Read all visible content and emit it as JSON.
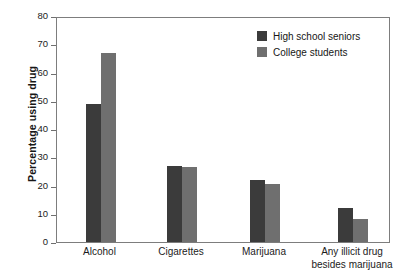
{
  "chart_data": {
    "type": "bar",
    "title": "",
    "xlabel": "",
    "ylabel": "Percentage using drug",
    "ylim": [
      0,
      80
    ],
    "yticks": [
      0,
      10,
      20,
      30,
      40,
      50,
      60,
      70,
      80
    ],
    "ytick_labels": [
      "0",
      "10",
      "20",
      "30",
      "40",
      "50",
      "60",
      "70",
      "80"
    ],
    "grid": false,
    "legend_position": "top-right",
    "categories": [
      "Alcohol",
      "Cigarettes",
      "Marijuana",
      "Any illicit drug\nbesides marijuana"
    ],
    "series": [
      {
        "name": "High school seniors",
        "color": "#3b3b3b",
        "values": [
          49,
          27,
          22,
          12
        ]
      },
      {
        "name": "College students",
        "color": "#6f6f6f",
        "values": [
          67,
          26.5,
          20.5,
          8
        ]
      }
    ]
  },
  "figure": {
    "background": "#ffffff",
    "frame_color": "#7d7d7d"
  }
}
